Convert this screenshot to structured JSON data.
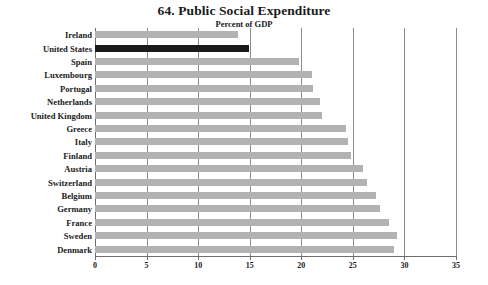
{
  "chart_data": {
    "type": "bar",
    "orientation": "horizontal",
    "title": "64. Public Social Expenditure",
    "subtitle": "Percent of GDP",
    "xlabel": "",
    "ylabel": "",
    "xlim": [
      0,
      35
    ],
    "xticks": [
      0,
      5,
      10,
      15,
      20,
      25,
      30,
      35
    ],
    "xtick_labels": [
      "0",
      "5",
      "10",
      "15",
      "20",
      "25",
      "30",
      "35"
    ],
    "grid": "vertical",
    "legend": "none",
    "categories": [
      "Ireland",
      "United States",
      "Spain",
      "Luxembourg",
      "Portugal",
      "Netherlands",
      "United Kingdom",
      "Greece",
      "Italy",
      "Finland",
      "Austria",
      "Switzerland",
      "Belgium",
      "Germany",
      "France",
      "Sweden",
      "Denmark"
    ],
    "values": [
      13.9,
      14.9,
      19.8,
      21.0,
      21.1,
      21.8,
      22.0,
      24.3,
      24.5,
      24.8,
      26.0,
      26.4,
      27.2,
      27.6,
      28.5,
      29.3,
      29.0
    ],
    "highlighted_category": "United States",
    "colors": {
      "bar": "#b2b2b2",
      "highlight_bar": "#1a1a1a",
      "grid": "#8c8c8c",
      "axis": "#6e6e6e",
      "text": "#1a1a1a",
      "background": "#ffffff"
    }
  }
}
